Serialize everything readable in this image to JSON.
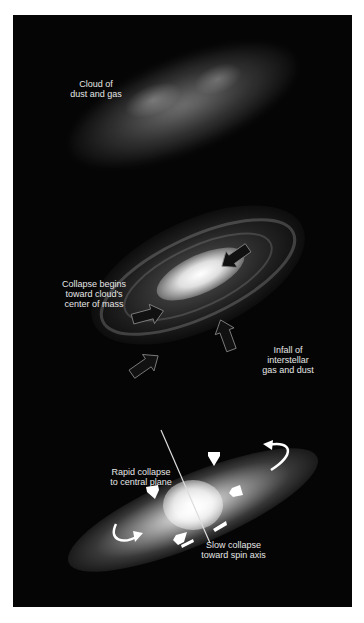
{
  "figure": {
    "background_color": "#050505",
    "stages": [
      {
        "id": "cloud",
        "labels": [
          {
            "text": "Cloud of\ndust and gas"
          }
        ]
      },
      {
        "id": "collapse",
        "labels": [
          {
            "text": "Collapse begins\ntoward cloud's\ncenter of mass"
          },
          {
            "text": "Infall of\ninterstellar\ngas and dust"
          }
        ],
        "arrows": {
          "count": 4,
          "color": "#111111",
          "direction": "inward"
        }
      },
      {
        "id": "flattening",
        "labels": [
          {
            "text": "Rapid collapse\nto central plane"
          },
          {
            "text": "Slow collapse\ntoward spin axis"
          }
        ],
        "arrows": {
          "count": 8,
          "color": "#ffffff",
          "direction": "inward"
        },
        "spin_axis": true
      }
    ]
  }
}
